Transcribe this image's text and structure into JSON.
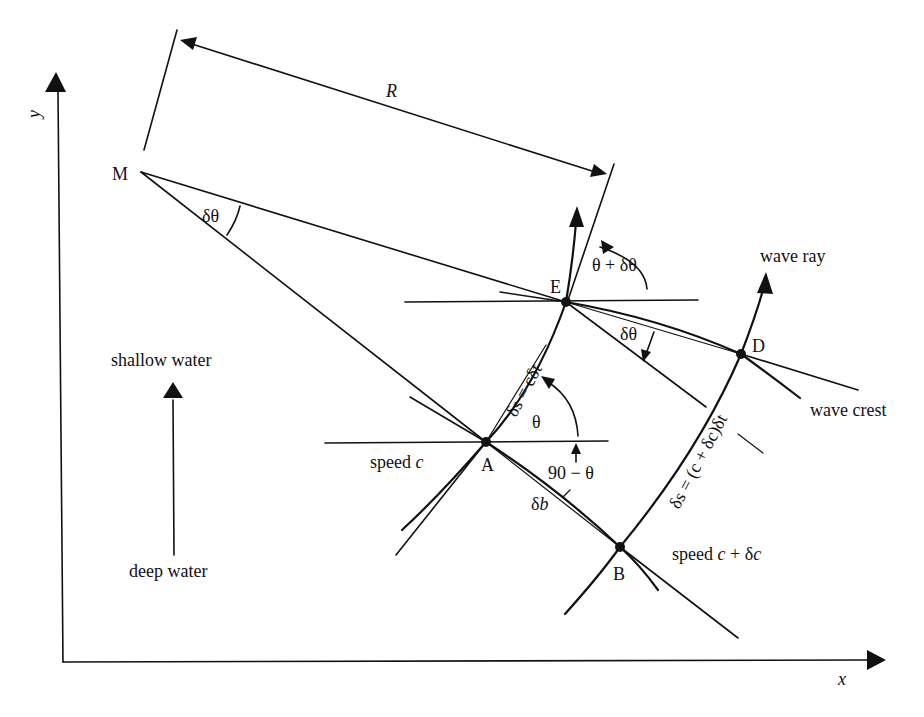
{
  "figure": {
    "type": "wave-refraction-geometry",
    "background": "#ffffff",
    "ink": "#111111"
  },
  "axes": {
    "x_label": "x",
    "y_label": "y"
  },
  "points": {
    "M": "M",
    "E": "E",
    "A": "A",
    "D": "D",
    "B": "B"
  },
  "labels": {
    "radius": "R",
    "delta_theta_at_M": "δθ",
    "theta_plus_delta": "θ + δθ",
    "delta_theta_at_E": "δθ",
    "theta": "θ",
    "ninety_minus_theta": "90 − θ",
    "delta_b": "δb",
    "ds_cdt": "δs = cδt",
    "ds_c_dc_dt": "δs = (c + δc)δt",
    "speed_c": "speed c",
    "speed_c_dc": "speed c + δc",
    "wave_ray": "wave ray",
    "wave_crest": "wave crest",
    "shallow_water": "shallow water",
    "deep_water": "deep water"
  }
}
